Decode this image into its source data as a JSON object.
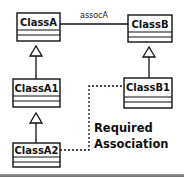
{
  "diagram": {
    "type": "UML class diagram",
    "classes": [
      {
        "id": "ClassA",
        "name": "ClassA"
      },
      {
        "id": "ClassB",
        "name": "ClassB"
      },
      {
        "id": "ClassA1",
        "name": "ClassA1"
      },
      {
        "id": "ClassB1",
        "name": "ClassB1"
      },
      {
        "id": "ClassA2",
        "name": "ClassA2"
      }
    ],
    "relations": [
      {
        "type": "association",
        "from": "ClassA",
        "to": "ClassB",
        "label": "assocA"
      },
      {
        "type": "generalization",
        "from": "ClassA1",
        "to": "ClassA"
      },
      {
        "type": "generalization",
        "from": "ClassA2",
        "to": "ClassA1"
      },
      {
        "type": "generalization",
        "from": "ClassB1",
        "to": "ClassB"
      },
      {
        "type": "dashed-dependency",
        "from": "ClassA2",
        "to": "ClassB1"
      }
    ],
    "annotation": {
      "line1": "Required",
      "line2": "Association"
    },
    "colors": {
      "stroke": "#111111",
      "background": "#ffffff"
    }
  }
}
